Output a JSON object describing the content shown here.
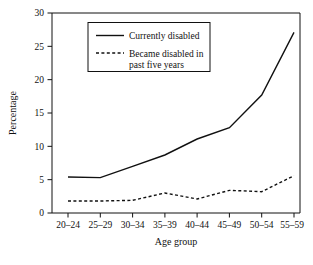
{
  "chart_data": {
    "type": "line",
    "title": "",
    "xlabel": "Age group",
    "ylabel": "Percentage",
    "categories": [
      "20–24",
      "25–29",
      "30–34",
      "35–39",
      "40–44",
      "45–49",
      "50–54",
      "55–59"
    ],
    "ylim": [
      0,
      30
    ],
    "yticks": [
      0,
      5,
      10,
      15,
      20,
      25,
      30
    ],
    "ytick_labels": [
      "0",
      "5",
      "10",
      "15",
      "20",
      "25",
      "30"
    ],
    "grid": false,
    "legend_position": "top-left-inside",
    "series": [
      {
        "name": "Currently disabled",
        "style": "solid",
        "color": "#111111",
        "values": [
          5.4,
          5.3,
          7.0,
          8.7,
          11.1,
          12.8,
          17.7,
          27.1
        ]
      },
      {
        "name": "Became disabled in past five years",
        "style": "dashed",
        "color": "#111111",
        "values": [
          1.8,
          1.8,
          1.9,
          3.0,
          2.1,
          3.4,
          3.2,
          5.6
        ]
      }
    ],
    "legend": [
      {
        "label": "Currently disabled",
        "style": "solid"
      },
      {
        "label": "Became disabled in",
        "label2": "past five years",
        "style": "dashed"
      }
    ]
  },
  "legend": {
    "entry1": "Currently disabled",
    "entry2_line1": "Became disabled in",
    "entry2_line2": "past five years"
  },
  "axes": {
    "y_title": "Percentage",
    "x_title": "Age group"
  }
}
